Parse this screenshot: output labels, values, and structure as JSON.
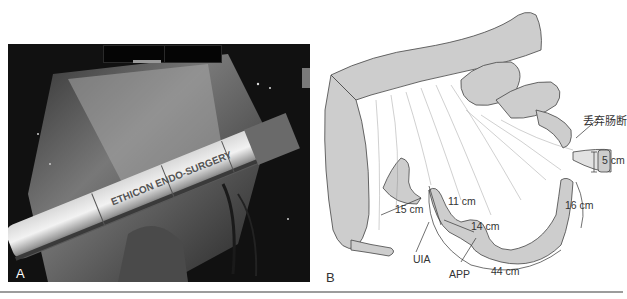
{
  "figure": {
    "panels": [
      {
        "id": "A",
        "label": "A",
        "type": "surgical-photo",
        "instrument_text": "ETHICON ENDO-SURGERY"
      },
      {
        "id": "B",
        "label": "B",
        "type": "anatomical-illustration",
        "annotations": {
          "discarded_segment": "丢弃肠断",
          "segment_length": "5 cm",
          "distance_16": "16 cm",
          "distance_15": "15 cm",
          "distance_11": "11 cm",
          "distance_14": "14 cm",
          "distance_44": "44 cm",
          "uia": "UIA",
          "app": "APP"
        }
      }
    ]
  },
  "colors": {
    "photo_bg": "#0c0c0c",
    "illustration_fill": "#c8c8c8",
    "line": "#444444",
    "rule": "#9c9c9c"
  }
}
